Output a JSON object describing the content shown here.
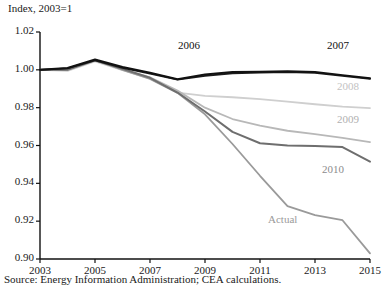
{
  "chart_data": {
    "type": "line",
    "title": "Index, 2003=1",
    "xlabel": "",
    "ylabel": "",
    "xlim": [
      2003,
      2015
    ],
    "ylim": [
      0.9,
      1.02
    ],
    "grid": false,
    "legend_position": "inline-annotations",
    "x_ticks": [
      "2003",
      "2005",
      "2007",
      "2009",
      "2011",
      "2013",
      "2015"
    ],
    "x_tick_values": [
      2003,
      2005,
      2007,
      2009,
      2011,
      2013,
      2015
    ],
    "y_ticks": [
      "0.90",
      "0.92",
      "0.94",
      "0.96",
      "0.98",
      "1.00",
      "1.02"
    ],
    "y_tick_values": [
      0.9,
      0.92,
      0.94,
      0.96,
      0.98,
      1.0,
      1.02
    ],
    "x": [
      2003,
      2004,
      2005,
      2006,
      2007,
      2008,
      2009,
      2010,
      2011,
      2012,
      2013,
      2014,
      2015
    ],
    "series": [
      {
        "name": "2006",
        "color": "#111111",
        "width": 2.0,
        "values": [
          1.0,
          1.001,
          1.0055,
          1.0015,
          0.9985,
          0.995,
          0.9975,
          0.9988,
          0.999,
          0.9992,
          0.9988,
          0.9972,
          0.9955
        ]
      },
      {
        "name": "2007",
        "color": "#1c1c1c",
        "width": 1.8,
        "values": [
          1.0,
          1.0008,
          1.005,
          1.001,
          0.998,
          0.9948,
          0.9968,
          0.9982,
          0.9986,
          0.9988,
          0.9984,
          0.9968,
          0.9952
        ]
      },
      {
        "name": "2008",
        "color": "#cfcfcf",
        "width": 1.8,
        "values": [
          1.0,
          0.9995,
          1.0045,
          0.9998,
          0.9955,
          0.988,
          0.9862,
          0.9855,
          0.9845,
          0.9832,
          0.9818,
          0.9805,
          0.9798
        ]
      },
      {
        "name": "2009",
        "color": "#b8b8b8",
        "width": 1.8,
        "values": [
          1.0,
          0.9998,
          1.0048,
          1.0002,
          0.996,
          0.989,
          0.98,
          0.974,
          0.9705,
          0.9678,
          0.966,
          0.964,
          0.9618
        ]
      },
      {
        "name": "2010",
        "color": "#6e6e6e",
        "width": 2.0,
        "values": [
          1.0,
          1.0,
          1.005,
          1.0005,
          0.9958,
          0.988,
          0.978,
          0.9672,
          0.9612,
          0.96,
          0.9598,
          0.9592,
          0.9515
        ]
      },
      {
        "name": "Actual",
        "color": "#9a9a9a",
        "width": 1.8,
        "values": [
          1.0,
          1.0002,
          1.0052,
          1.0,
          0.9952,
          0.9878,
          0.9765,
          0.9608,
          0.944,
          0.928,
          0.9232,
          0.9205,
          0.903
        ]
      }
    ],
    "annotations": [
      {
        "text": "2006",
        "x_px": 178,
        "y_px": 39,
        "color": "#111111"
      },
      {
        "text": "2007",
        "x_px": 327,
        "y_px": 39,
        "color": "#111111"
      },
      {
        "text": "2008",
        "x_px": 337,
        "y_px": 80,
        "color": "#c2c2c2"
      },
      {
        "text": "2009",
        "x_px": 337,
        "y_px": 113,
        "color": "#b0b0b0"
      },
      {
        "text": "2010",
        "x_px": 322,
        "y_px": 163,
        "color": "#8c8c8c"
      },
      {
        "text": "Actual",
        "x_px": 268,
        "y_px": 213,
        "color": "#9a9a9a"
      }
    ],
    "source": "Source: Energy Information Administration; CEA calculations."
  },
  "axis_geometry": {
    "left_px": 40,
    "right_px": 370,
    "top_px": 32,
    "bottom_px": 259
  }
}
